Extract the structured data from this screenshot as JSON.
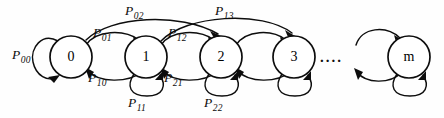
{
  "figure": {
    "type": "state-diagram",
    "background_color": "#fefefe",
    "stroke_color": "#0d0d0d",
    "width": 444,
    "height": 118
  },
  "states": [
    {
      "id": "s0",
      "label": "0",
      "cx": 71,
      "cy": 57,
      "r": 21
    },
    {
      "id": "s1",
      "label": "1",
      "cx": 146,
      "cy": 57,
      "r": 21
    },
    {
      "id": "s2",
      "label": "2",
      "cx": 221,
      "cy": 57,
      "r": 21
    },
    {
      "id": "s3",
      "label": "3",
      "cx": 294,
      "cy": 57,
      "r": 21
    },
    {
      "id": "sm",
      "label": "m",
      "cx": 409,
      "cy": 57,
      "r": 21
    }
  ],
  "ellipsis": {
    "text": "....",
    "x": 320,
    "y": 62
  },
  "transitions": [
    {
      "id": "t00",
      "from": "0",
      "to": "0",
      "label": "P",
      "sub": "00",
      "label_x": 12,
      "label_y": 48,
      "kind": "self-loop"
    },
    {
      "id": "t01",
      "from": "0",
      "to": "1",
      "label": "P",
      "sub": "01",
      "label_x": 93,
      "label_y": 26,
      "kind": "forward"
    },
    {
      "id": "t02",
      "from": "0",
      "to": "2",
      "label": "P",
      "sub": "02",
      "label_x": 125,
      "label_y": 4,
      "kind": "forward-long"
    },
    {
      "id": "t10",
      "from": "1",
      "to": "0",
      "label": "P",
      "sub": "10",
      "label_x": 88,
      "label_y": 71,
      "kind": "backward"
    },
    {
      "id": "t11",
      "from": "1",
      "to": "1",
      "label": "P",
      "sub": "11",
      "label_x": 128,
      "label_y": 96,
      "kind": "self-loop"
    },
    {
      "id": "t12",
      "from": "1",
      "to": "2",
      "label": "P",
      "sub": "12",
      "label_x": 168,
      "label_y": 26,
      "kind": "forward"
    },
    {
      "id": "t13",
      "from": "1",
      "to": "3",
      "label": "P",
      "sub": "13",
      "label_x": 215,
      "label_y": 4,
      "kind": "forward-long"
    },
    {
      "id": "t21",
      "from": "2",
      "to": "1",
      "label": "P",
      "sub": "21",
      "label_x": 164,
      "label_y": 71,
      "kind": "backward"
    },
    {
      "id": "t22",
      "from": "2",
      "to": "2",
      "label": "P",
      "sub": "22",
      "label_x": 204,
      "label_y": 96,
      "kind": "self-loop"
    },
    {
      "id": "t23",
      "from": "2",
      "to": "3",
      "label": "",
      "sub": "",
      "label_x": 0,
      "label_y": 0,
      "kind": "forward"
    },
    {
      "id": "t32",
      "from": "3",
      "to": "2",
      "label": "",
      "sub": "",
      "label_x": 0,
      "label_y": 0,
      "kind": "backward"
    },
    {
      "id": "t33",
      "from": "3",
      "to": "3",
      "label": "",
      "sub": "",
      "label_x": 0,
      "label_y": 0,
      "kind": "self-loop"
    },
    {
      "id": "tpm",
      "from": "prev",
      "to": "m",
      "label": "",
      "sub": "",
      "label_x": 0,
      "label_y": 0,
      "kind": "forward"
    },
    {
      "id": "tmp",
      "from": "m",
      "to": "prev",
      "label": "",
      "sub": "",
      "label_x": 0,
      "label_y": 0,
      "kind": "backward"
    },
    {
      "id": "tmm",
      "from": "m",
      "to": "m",
      "label": "",
      "sub": "",
      "label_x": 0,
      "label_y": 0,
      "kind": "self-loop"
    }
  ]
}
